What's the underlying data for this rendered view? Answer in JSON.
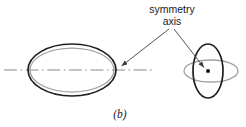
{
  "figure": {
    "caption": "(b)",
    "annotation": {
      "line1": "symmetry",
      "line2": "axis"
    },
    "colors": {
      "background": "#ffffff",
      "outline_dark": "#1a1a1a",
      "outline_gray": "#9a9a9a",
      "axis_line": "#808080",
      "leader_line": "#4a4a4a",
      "marker": "#000000",
      "text": "#1a1a1a"
    },
    "elements": [
      {
        "name": "side-view-body-ellipse",
        "role": "prolate spheroid shown edge-on, dark outline",
        "cx": 72,
        "cy": 70,
        "rx": 44,
        "ry": 26
      },
      {
        "name": "side-view-equator-ellipse",
        "role": "equatorial circle seen nearly edge-on, gray outline",
        "cx": 72,
        "cy": 70,
        "rx": 42,
        "ry": 22
      },
      {
        "name": "symmetry-axis-line",
        "role": "dash-dot center line through side view",
        "x1": 4,
        "y1": 70,
        "x2": 152,
        "y2": 70
      },
      {
        "name": "end-view-body-ellipse",
        "role": "same body viewed along axis, tall dark outline",
        "cx": 208,
        "cy": 71,
        "rx": 15,
        "ry": 27
      },
      {
        "name": "end-view-equator-ellipse",
        "role": "equatorial circle seen obliquely, wide gray outline",
        "cx": 211,
        "cy": 71,
        "rx": 27,
        "ry": 11
      },
      {
        "name": "axis-point-marker",
        "role": "axis seen end-on as a point",
        "cx": 208,
        "cy": 71,
        "size": 3
      },
      {
        "name": "leader-left",
        "role": "arrow from label to axis line",
        "from": [
          169,
          29
        ],
        "to": [
          120,
          67
        ]
      },
      {
        "name": "leader-right",
        "role": "arrow from label to axis point marker",
        "from": [
          174,
          29
        ],
        "to": [
          205,
          68
        ]
      }
    ]
  }
}
